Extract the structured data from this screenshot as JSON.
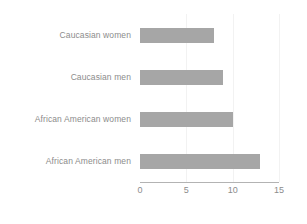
{
  "chart_data": {
    "type": "bar",
    "orientation": "horizontal",
    "title": "",
    "xlabel": "",
    "ylabel": "",
    "categories": [
      "Caucasian women",
      "Caucasian men",
      "African American women",
      "African American men"
    ],
    "values": [
      8,
      9,
      10,
      13
    ],
    "series": [
      {
        "name": "",
        "values": [
          8,
          9,
          10,
          13
        ]
      }
    ],
    "xlim": [
      0,
      15
    ],
    "xticks": [
      0,
      5,
      10,
      15
    ],
    "xtick_labels": [
      "0",
      "5",
      "10",
      "15"
    ],
    "grid": true,
    "grid_axis": "x",
    "legend": false,
    "legend_position": "none",
    "bar_color": "#a6a6a6",
    "gridline_color": "#f2f2f2",
    "axis_line_color": "#b3b3b3",
    "tick_label_color": "#8c8c8c",
    "background_color": "#ffffff"
  }
}
